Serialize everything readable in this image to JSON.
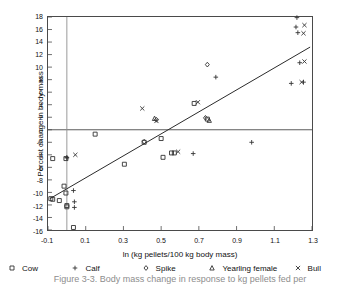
{
  "chart_data": {
    "type": "scatter",
    "title": "",
    "xlabel": "ln (kg pellets/100 kg body mass)",
    "ylabel": "Percent change in body mass",
    "xlim": [
      -0.1,
      1.3
    ],
    "ylim": [
      -16,
      18
    ],
    "xticks": [
      "-0.1",
      "0.1",
      "0.3",
      "0.5",
      "0.7",
      "0.9",
      "1.1",
      "1.3"
    ],
    "xtick_values": [
      -0.1,
      0.1,
      0.3,
      0.5,
      0.7,
      0.9,
      1.1,
      1.3
    ],
    "yticks": [
      "18",
      "16",
      "14",
      "12",
      "10",
      "8",
      "6",
      "4",
      "2",
      "0",
      "-2",
      "-4",
      "-6",
      "-8",
      "-10",
      "-12",
      "-14",
      "-16"
    ],
    "ytick_values": [
      18,
      16,
      14,
      12,
      10,
      8,
      6,
      4,
      2,
      0,
      -2,
      -4,
      -6,
      -8,
      -10,
      -12,
      -14,
      -16
    ],
    "grid": false,
    "legend_position": "below-axis",
    "reference_lines": [
      {
        "name": "zero-horizontal",
        "orientation": "horizontal",
        "value": 0,
        "color": "#4a4a4a"
      },
      {
        "name": "zero-vertical",
        "orientation": "vertical",
        "value": 0.0,
        "color": "#8e8e8e"
      }
    ],
    "trend_line": {
      "name": "regression-line",
      "color": "#2b2b2b",
      "x1": -0.09,
      "y1": -11.0,
      "x2": 1.29,
      "y2": 13.2
    },
    "series": [
      {
        "name": "Cow",
        "marker": "square",
        "color": "#333333",
        "points": [
          [
            -0.075,
            -4.6
          ],
          [
            -0.085,
            -11.0
          ],
          [
            -0.075,
            -11.1
          ],
          [
            -0.015,
            -9.0
          ],
          [
            -0.005,
            -4.6
          ],
          [
            -0.005,
            -10.1
          ],
          [
            0.0,
            -12.1
          ],
          [
            0.0,
            -12.3
          ],
          [
            -0.04,
            -11.3
          ],
          [
            0.035,
            -15.6
          ],
          [
            0.15,
            -0.7
          ],
          [
            0.305,
            -5.5
          ],
          [
            0.41,
            -2.0
          ],
          [
            0.5,
            -1.4
          ],
          [
            0.51,
            -4.4
          ],
          [
            0.555,
            -3.7
          ],
          [
            0.57,
            -3.7
          ],
          [
            0.675,
            4.2
          ],
          [
            0.745,
            1.7
          ]
        ]
      },
      {
        "name": "Calf",
        "marker": "plus",
        "color": "#333333",
        "points": [
          [
            0.0,
            -4.5
          ],
          [
            0.0,
            -4.4
          ],
          [
            0.035,
            -9.7
          ],
          [
            0.04,
            -11.5
          ],
          [
            0.04,
            -12.4
          ],
          [
            0.67,
            -3.8
          ],
          [
            0.79,
            8.4
          ],
          [
            0.98,
            -2.0
          ],
          [
            1.19,
            7.4
          ],
          [
            1.215,
            16.4
          ],
          [
            1.22,
            17.9
          ],
          [
            1.225,
            15.5
          ],
          [
            1.235,
            10.7
          ],
          [
            1.255,
            7.6
          ]
        ]
      },
      {
        "name": "Spike",
        "marker": "diamond",
        "color": "#333333",
        "points": [
          [
            0.41,
            -1.9
          ],
          [
            0.475,
            1.6
          ],
          [
            0.735,
            1.9
          ],
          [
            0.745,
            10.4
          ]
        ]
      },
      {
        "name": "Yearling female",
        "marker": "triangle",
        "color": "#333333",
        "points": [
          [
            0.465,
            1.8
          ],
          [
            0.755,
            1.5
          ]
        ]
      },
      {
        "name": "Bull",
        "marker": "cross",
        "color": "#333333",
        "points": [
          [
            0.045,
            -4.0
          ],
          [
            0.4,
            3.4
          ],
          [
            0.475,
            1.4
          ],
          [
            0.59,
            -3.5
          ],
          [
            0.695,
            4.4
          ],
          [
            1.26,
            16.7
          ],
          [
            1.255,
            15.4
          ],
          [
            1.26,
            10.9
          ],
          [
            1.245,
            7.6
          ]
        ]
      }
    ],
    "legend": [
      {
        "label": "Cow",
        "marker": "square"
      },
      {
        "label": "Calf",
        "marker": "plus"
      },
      {
        "label": "Spike",
        "marker": "diamond"
      },
      {
        "label": "Yearling female",
        "marker": "triangle"
      },
      {
        "label": "Bull",
        "marker": "cross"
      }
    ]
  },
  "caption": {
    "text": "Figure 3-3. Body mass change in response to kg pellets fed per"
  }
}
